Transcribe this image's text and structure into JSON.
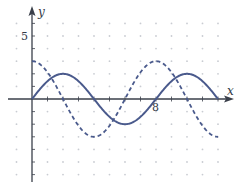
{
  "chart_data": {
    "type": "line",
    "title": "",
    "xlabel": "x",
    "ylabel": "y",
    "x_tick_labels": [
      {
        "value": 8,
        "label": "8"
      }
    ],
    "y_tick_labels": [
      {
        "value": 5,
        "label": "5"
      }
    ],
    "xlim": [
      -2,
      13
    ],
    "ylim": [
      -7,
      7
    ],
    "grid": "dotted",
    "legend": null,
    "series": [
      {
        "name": "solid curve",
        "style": "solid",
        "color": "#4a5a8c",
        "formula": "y = 2 sin(pi x / 4)",
        "x": [
          0,
          1,
          2,
          3,
          4,
          5,
          6,
          7,
          8,
          9,
          10,
          11,
          12
        ],
        "values": [
          0,
          1.41,
          2,
          1.41,
          0,
          -1.41,
          -2,
          -1.41,
          0,
          1.41,
          2,
          1.41,
          0
        ]
      },
      {
        "name": "dashed curve",
        "style": "dashed",
        "color": "#4a5a8c",
        "formula": "y = 3 cos(pi x / 4)",
        "x": [
          0,
          1,
          2,
          3,
          4,
          5,
          6,
          7,
          8,
          9,
          10,
          11,
          12
        ],
        "values": [
          3,
          2.12,
          0,
          -2.12,
          -3,
          -2.12,
          0,
          2.12,
          3,
          2.12,
          0,
          -2.12,
          -3
        ]
      }
    ]
  },
  "axes": {
    "x_label": "x",
    "y_label": "y",
    "x_tick_8": "8",
    "y_tick_5": "5"
  },
  "colors": {
    "curve": "#4a5a8c",
    "axis": "#3a3f4a",
    "grid_dot": "#c9ccd2"
  }
}
